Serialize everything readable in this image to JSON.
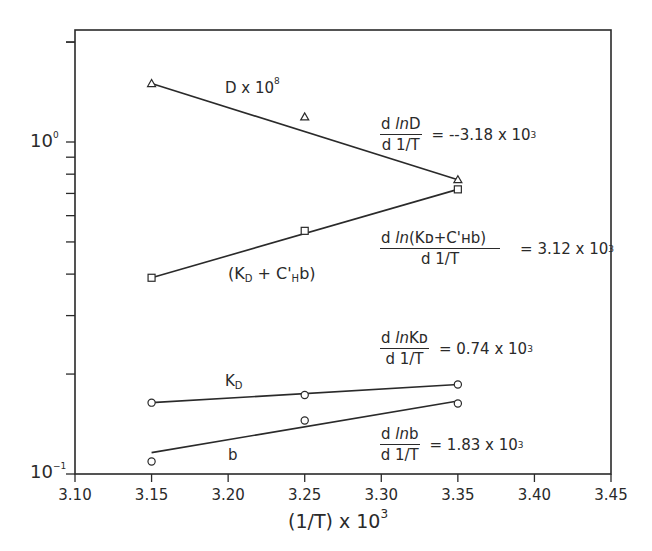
{
  "chart_data": {
    "type": "line",
    "title": "",
    "xlabel": "(1/T) x 10^3",
    "ylabel": "",
    "yscale": "log",
    "xlim": [
      3.1,
      3.45
    ],
    "ylim": [
      0.1,
      2.2
    ],
    "grid": false,
    "x_ticks": [
      "3.10",
      "3.15",
      "3.20",
      "3.25",
      "3.30",
      "3.35",
      "3.40",
      "3.45"
    ],
    "y_ticks": [
      "10^-1",
      "10^0"
    ],
    "x": [
      3.15,
      3.25,
      3.35
    ],
    "series": [
      {
        "name": "D x 10^8",
        "marker": "triangle",
        "values": [
          1.5,
          1.19,
          0.77
        ],
        "fit": {
          "x": [
            3.15,
            3.35
          ],
          "y": [
            1.5,
            0.77
          ]
        }
      },
      {
        "name": "(K_D + C'_H b)",
        "marker": "square",
        "values": [
          0.39,
          0.54,
          0.72
        ],
        "fit": {
          "x": [
            3.15,
            3.35
          ],
          "y": [
            0.39,
            0.72
          ]
        }
      },
      {
        "name": "K_D",
        "marker": "circle",
        "values": [
          0.164,
          0.173,
          0.186
        ],
        "fit": {
          "x": [
            3.15,
            3.35
          ],
          "y": [
            0.164,
            0.186
          ]
        }
      },
      {
        "name": "b",
        "marker": "circle",
        "values": [
          0.109,
          0.145,
          0.163
        ],
        "fit": {
          "x": [
            3.15,
            3.35
          ],
          "y": [
            0.116,
            0.166
          ]
        }
      }
    ],
    "annotations": [
      {
        "numerator": "d lnD",
        "denominator": "d 1/T",
        "value": "= --3.18 x 10^3"
      },
      {
        "numerator": "d ln(KD+C'Hb)",
        "denominator": "d 1/T",
        "value": "= 3.12 x 10^3"
      },
      {
        "numerator": "d lnKD",
        "denominator": "d 1/T",
        "value": "= 0.74 x 10^3"
      },
      {
        "numerator": "d lnb",
        "denominator": "d 1/T",
        "value": "= 1.83 x 10^3"
      }
    ]
  },
  "labels": {
    "x_axis": {
      "main": "(1/T) x 10",
      "exp": "3"
    },
    "y_tick_top": {
      "base": "10",
      "exp": "0"
    },
    "y_tick_bottom": {
      "base": "10",
      "exp": "−1"
    },
    "series_D": {
      "main": "D x 10",
      "exp": "8"
    },
    "series_KC": {
      "open": "(K",
      "sub1": "D",
      "mid": " + C'",
      "sub2": "H",
      "close": "b)"
    },
    "series_KD": {
      "main": "K",
      "sub": "D"
    },
    "series_b": {
      "main": "b"
    },
    "slope_D": {
      "num_d": "d ",
      "num_ln": "ln",
      "num_rest": "D",
      "den": "d 1/T",
      "eq": "=  --3.18 x 10",
      "exp": "3"
    },
    "slope_KC": {
      "num_d": "d ",
      "num_ln": "ln",
      "num_rest": "(Kᴅ+C'ʜb)",
      "den": "d 1/T",
      "eq": "=  3.12 x 10",
      "exp": "3"
    },
    "slope_KD": {
      "num_d": "d ",
      "num_ln": "ln",
      "num_rest": "Kᴅ",
      "den": "d 1/T",
      "eq": "=  0.74 x 10",
      "exp": "3"
    },
    "slope_b": {
      "num_d": "d ",
      "num_ln": "ln",
      "num_rest": "b",
      "den": "d 1/T",
      "eq": "=  1.83 x 10",
      "exp": "3"
    }
  }
}
